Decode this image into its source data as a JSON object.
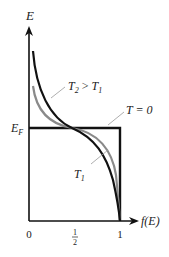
{
  "diagram": {
    "y_axis_label": "E",
    "x_axis_label": "f(E)",
    "fermi_level_label": "E",
    "fermi_level_sub": "F",
    "x_ticks": [
      "0",
      "1",
      "1"
    ],
    "half_num": "1",
    "half_den": "2",
    "curves": [
      {
        "name": "T = 0",
        "label": "T = 0",
        "color": "#111111"
      },
      {
        "name": "T1",
        "label_main": "T",
        "label_sub": "1",
        "color": "#111111"
      },
      {
        "name": "T2",
        "label_main": "T",
        "label_sub": "2",
        "label_rel": " > ",
        "label_main2": "T",
        "label_sub2": "1",
        "color": "#8a8a8a"
      }
    ]
  }
}
